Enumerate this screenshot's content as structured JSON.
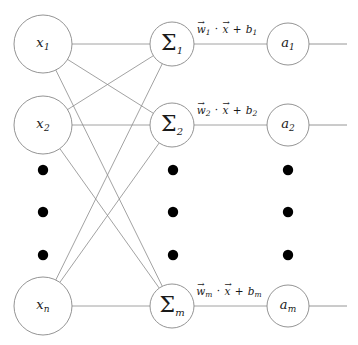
{
  "figure": {
    "background_color": "#ffffff",
    "line_color": "#8a8a8a",
    "text_color": "#1a1a1a",
    "dot_color": "#000000"
  },
  "layers": {
    "input": {
      "name": "input-layer",
      "nodes": [
        {
          "id": "x1",
          "base": "x",
          "sub": "1",
          "cx": 43,
          "cy": 44,
          "r": 29
        },
        {
          "id": "x2",
          "base": "x",
          "sub": "2",
          "cx": 43,
          "cy": 125,
          "r": 29
        },
        {
          "id": "xn",
          "base": "x",
          "sub": "n",
          "cx": 43,
          "cy": 306,
          "r": 29
        }
      ],
      "ellipsis": {
        "cx": 43,
        "ys": [
          170,
          212,
          255
        ],
        "r": 5.2
      }
    },
    "summation": {
      "name": "summation-layer",
      "symbol": "Σ",
      "nodes": [
        {
          "id": "sum1",
          "base": "Σ",
          "sub": "1",
          "cx": 172,
          "cy": 44,
          "r": 22
        },
        {
          "id": "sum2",
          "base": "Σ",
          "sub": "2",
          "cx": 172,
          "cy": 125,
          "r": 22
        },
        {
          "id": "summ",
          "base": "Σ",
          "sub": "m",
          "cx": 172,
          "cy": 306,
          "r": 22
        }
      ],
      "ellipsis": {
        "cx": 173,
        "ys": [
          170,
          212,
          255
        ],
        "r": 5.2
      }
    },
    "activation": {
      "name": "activation-layer",
      "nodes": [
        {
          "id": "a1",
          "base": "a",
          "sub": "1",
          "cx": 288,
          "cy": 44,
          "r": 21
        },
        {
          "id": "a2",
          "base": "a",
          "sub": "2",
          "cx": 288,
          "cy": 125,
          "r": 21
        },
        {
          "id": "am",
          "base": "a",
          "sub": "m",
          "cx": 288,
          "cy": 306,
          "r": 21
        }
      ],
      "ellipsis": {
        "cx": 288,
        "ys": [
          170,
          212,
          255
        ],
        "r": 5.2
      }
    }
  },
  "edge_labels": [
    {
      "id": "label-1",
      "text": "w⃗1 · x⃗ + b1",
      "w_sub": "1",
      "b_sub": "1",
      "x": 227,
      "y": 30
    },
    {
      "id": "label-2",
      "text": "w⃗2 · x⃗ + b2",
      "w_sub": "2",
      "b_sub": "2",
      "x": 227,
      "y": 111
    },
    {
      "id": "label-m",
      "text": "w⃗m · x⃗ + bm",
      "w_sub": "m",
      "b_sub": "m",
      "x": 229,
      "y": 292
    }
  ],
  "connections": {
    "input_to_sum": [
      {
        "from": "x1",
        "to": "sum1"
      },
      {
        "from": "x1",
        "to": "sum2"
      },
      {
        "from": "x1",
        "to": "summ"
      },
      {
        "from": "x2",
        "to": "sum1"
      },
      {
        "from": "x2",
        "to": "sum2"
      },
      {
        "from": "x2",
        "to": "summ"
      },
      {
        "from": "xn",
        "to": "sum1"
      },
      {
        "from": "xn",
        "to": "sum2"
      },
      {
        "from": "xn",
        "to": "summ"
      }
    ],
    "sum_to_activation": [
      {
        "from": "sum1",
        "to": "a1"
      },
      {
        "from": "sum2",
        "to": "a2"
      },
      {
        "from": "summ",
        "to": "am"
      }
    ],
    "outputs": [
      {
        "from": "a1",
        "x_end": 347
      },
      {
        "from": "a2",
        "x_end": 347
      },
      {
        "from": "am",
        "x_end": 347
      }
    ]
  }
}
